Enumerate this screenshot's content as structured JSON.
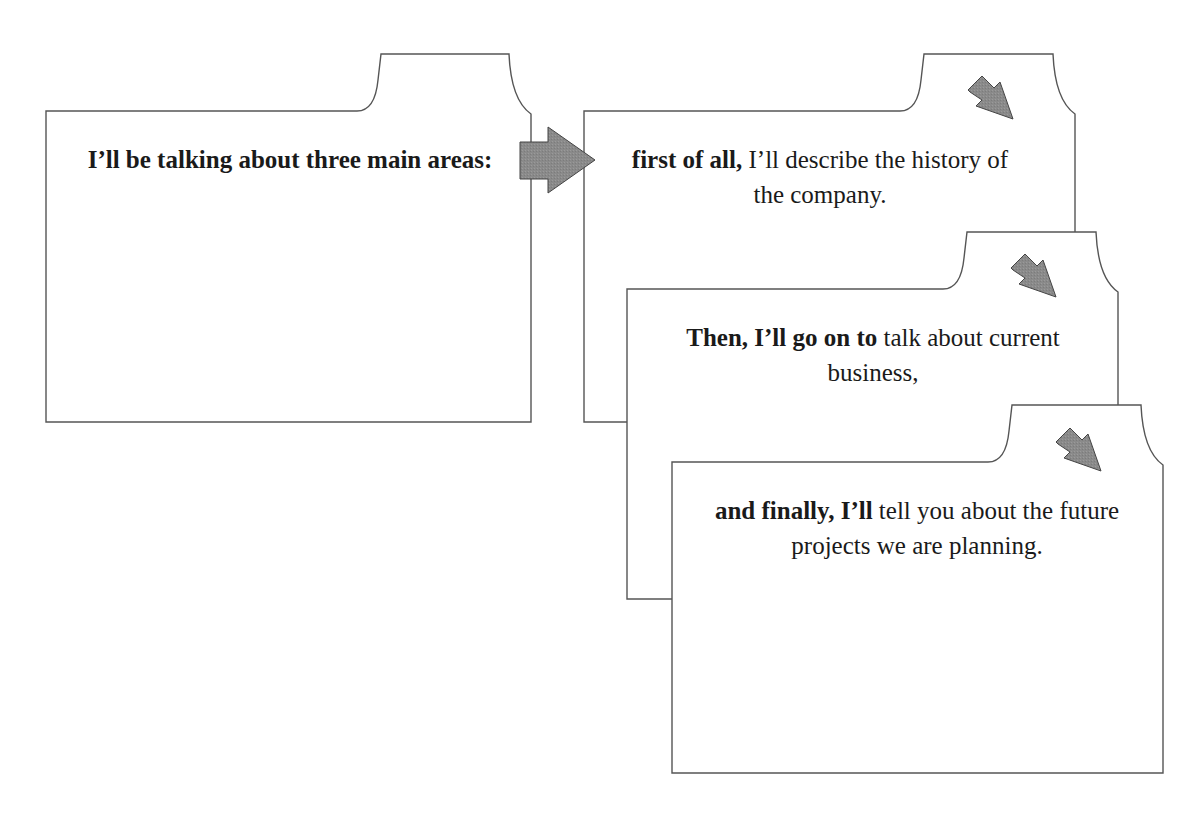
{
  "diagram": {
    "colors": {
      "card_stroke": "#555555",
      "card_fill": "#ffffff",
      "arrow_fill": "#8a8a8a",
      "arrow_stroke": "#444444",
      "text": "#1a1a1a"
    },
    "cards": [
      {
        "id": "intro",
        "bold": "I’ll be talking about three main areas:",
        "normal": ""
      },
      {
        "id": "first",
        "bold": "first of all,",
        "normal": " I’ll describe the history of the company."
      },
      {
        "id": "then",
        "bold": "Then, I’ll go on to",
        "normal": " talk about current business,"
      },
      {
        "id": "finally",
        "bold": "and finally, I’ll",
        "normal": " tell you about the future projects we are planning."
      }
    ],
    "arrows": [
      {
        "from": "intro",
        "to": "first",
        "direction": "right",
        "icon": "right-arrow-icon"
      },
      {
        "on": "first",
        "direction": "down-right",
        "icon": "diagonal-arrow-icon"
      },
      {
        "on": "then",
        "direction": "down-right",
        "icon": "diagonal-arrow-icon"
      },
      {
        "on": "finally",
        "direction": "down-right",
        "icon": "diagonal-arrow-icon"
      }
    ]
  }
}
